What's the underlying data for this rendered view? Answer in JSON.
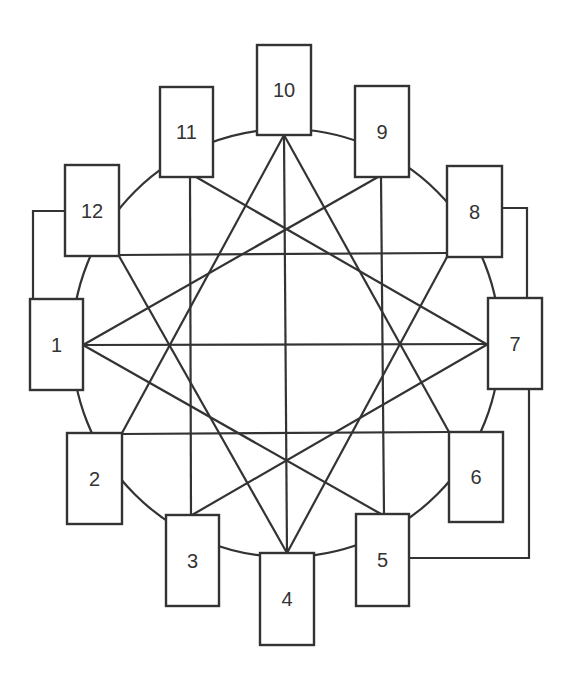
{
  "diagram": {
    "type": "network",
    "stroke_color": "#333333",
    "background": "#ffffff",
    "circle": {
      "cx": 286,
      "cy": 343,
      "r": 214
    },
    "nodes": [
      {
        "id": "1",
        "label": "1",
        "x": 30,
        "y": 299,
        "w": 53,
        "h": 91
      },
      {
        "id": "2",
        "label": "2",
        "x": 67,
        "y": 433,
        "w": 55,
        "h": 91
      },
      {
        "id": "3",
        "label": "3",
        "x": 166,
        "y": 515,
        "w": 53,
        "h": 91
      },
      {
        "id": "4",
        "label": "4",
        "x": 260,
        "y": 553,
        "w": 54,
        "h": 92
      },
      {
        "id": "5",
        "label": "5",
        "x": 356,
        "y": 514,
        "w": 53,
        "h": 92
      },
      {
        "id": "6",
        "label": "6",
        "x": 449,
        "y": 432,
        "w": 54,
        "h": 90
      },
      {
        "id": "7",
        "label": "7",
        "x": 488,
        "y": 298,
        "w": 54,
        "h": 91
      },
      {
        "id": "8",
        "label": "8",
        "x": 447,
        "y": 166,
        "w": 55,
        "h": 91
      },
      {
        "id": "9",
        "label": "9",
        "x": 355,
        "y": 86,
        "w": 54,
        "h": 91
      },
      {
        "id": "10",
        "label": "10",
        "x": 257,
        "y": 45,
        "w": 54,
        "h": 90
      },
      {
        "id": "11",
        "label": "11",
        "x": 160,
        "y": 87,
        "w": 53,
        "h": 90
      },
      {
        "id": "12",
        "label": "12",
        "x": 65,
        "y": 165,
        "w": 54,
        "h": 91
      }
    ],
    "edges": [
      {
        "from": "10",
        "to": "4",
        "x1": 284,
        "y1": 135,
        "x2": 287,
        "y2": 553
      },
      {
        "from": "10",
        "to": "2",
        "x1": 284,
        "y1": 135,
        "x2": 122,
        "y2": 433
      },
      {
        "from": "10",
        "to": "6",
        "x1": 284,
        "y1": 135,
        "x2": 449,
        "y2": 432
      },
      {
        "from": "11",
        "to": "3",
        "x1": 190,
        "y1": 177,
        "x2": 191,
        "y2": 515
      },
      {
        "from": "11",
        "to": "7",
        "x1": 196,
        "y1": 177,
        "x2": 488,
        "y2": 345
      },
      {
        "from": "9",
        "to": "5",
        "x1": 381,
        "y1": 177,
        "x2": 384,
        "y2": 514
      },
      {
        "from": "9",
        "to": "1",
        "x1": 378,
        "y1": 177,
        "x2": 83,
        "y2": 345
      },
      {
        "from": "12",
        "to": "8",
        "x1": 119,
        "y1": 255,
        "x2": 447,
        "y2": 253
      },
      {
        "from": "12",
        "to": "4",
        "x1": 119,
        "y1": 256,
        "x2": 287,
        "y2": 553
      },
      {
        "from": "8",
        "to": "4",
        "x1": 447,
        "y1": 257,
        "x2": 287,
        "y2": 553
      },
      {
        "from": "1",
        "to": "7",
        "x1": 83,
        "y1": 345,
        "x2": 488,
        "y2": 344
      },
      {
        "from": "1",
        "to": "5",
        "x1": 83,
        "y1": 345,
        "x2": 381,
        "y2": 514
      },
      {
        "from": "7",
        "to": "3",
        "x1": 488,
        "y1": 344,
        "x2": 192,
        "y2": 515
      },
      {
        "from": "2",
        "to": "6",
        "x1": 122,
        "y1": 434,
        "x2": 449,
        "y2": 432
      }
    ],
    "outer_connectors": [
      {
        "from": "12",
        "to": "1",
        "points": "65,211 33,211 33,299"
      },
      {
        "from": "8",
        "to": "7",
        "points": "502,208 527,208 527,298"
      },
      {
        "from": "7",
        "to": "5",
        "points": "529,389 529,558 409,558"
      }
    ]
  }
}
